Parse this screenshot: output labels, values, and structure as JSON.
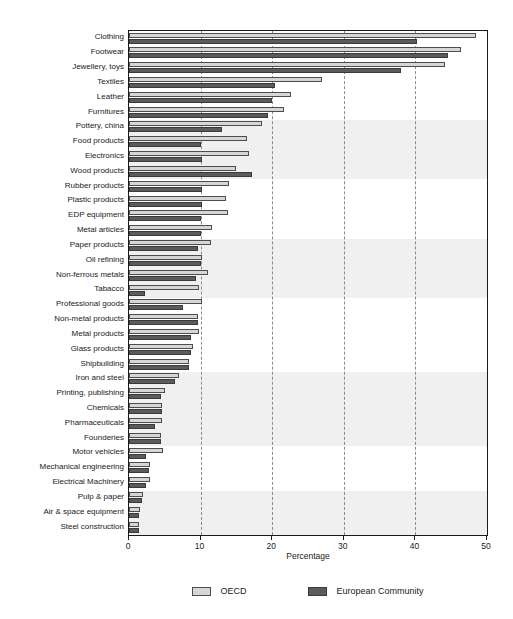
{
  "chart_data": {
    "type": "bar",
    "orientation": "horizontal",
    "title": "",
    "xlabel": "Percentage",
    "ylabel": "",
    "xlim": [
      0,
      50
    ],
    "xticks": [
      0,
      10,
      20,
      30,
      40,
      50
    ],
    "xticklabels": [
      "0",
      "10",
      "20",
      "30",
      "40",
      "50"
    ],
    "gridlines": [
      10,
      20,
      30,
      40
    ],
    "grid": true,
    "legend_position": "bottom",
    "categories": [
      "Clothing",
      "Footwear",
      "Jewellery, toys",
      "Textiles",
      "Leather",
      "Furnitures",
      "Pottery, china",
      "Food products",
      "Electronics",
      "Wood products",
      "Rubber products",
      "Plastic products",
      "EDP equipment",
      "Metal articles",
      "Paper products",
      "Oil refining",
      "Non-ferrous metals",
      "Tabacco",
      "Professional goods",
      "Non-metal products",
      "Metal products",
      "Glass products",
      "Shipbuilding",
      "Iron and steel",
      "Printing, publishing",
      "Chemicals",
      "Pharmaceuticals",
      "Founderies",
      "Motor vehicles",
      "Mechanical engineering",
      "Electrical Machinery",
      "Pulp & paper",
      "Air & space equipment",
      "Steel construction"
    ],
    "series": [
      {
        "name": "OECD",
        "color": "#d6d6d6",
        "values": [
          48.5,
          46.3,
          44.2,
          27.0,
          22.6,
          21.6,
          18.6,
          16.5,
          16.8,
          15.0,
          14.0,
          13.6,
          13.8,
          11.6,
          11.4,
          10.2,
          11.0,
          9.8,
          10.2,
          9.6,
          9.8,
          9.0,
          8.4,
          7.0,
          5.0,
          4.6,
          4.6,
          4.4,
          4.8,
          3.0,
          3.0,
          2.0,
          1.6,
          1.4
        ]
      },
      {
        "name": "European Community",
        "color": "#5b5b5b",
        "values": [
          40.2,
          44.5,
          38.0,
          20.4,
          20.0,
          19.4,
          13.0,
          10.0,
          10.2,
          17.2,
          10.2,
          10.2,
          10.0,
          10.0,
          9.6,
          10.0,
          9.4,
          2.2,
          7.6,
          9.6,
          8.6,
          8.6,
          8.4,
          6.4,
          4.4,
          4.6,
          3.6,
          4.4,
          2.4,
          2.8,
          2.4,
          1.8,
          1.4,
          1.4
        ]
      }
    ],
    "band_groups": [
      {
        "start": 0,
        "end": 6,
        "shaded": false
      },
      {
        "start": 6,
        "end": 10,
        "shaded": true
      },
      {
        "start": 10,
        "end": 14,
        "shaded": false
      },
      {
        "start": 14,
        "end": 18,
        "shaded": true
      },
      {
        "start": 18,
        "end": 23,
        "shaded": false
      },
      {
        "start": 23,
        "end": 28,
        "shaded": true
      },
      {
        "start": 28,
        "end": 31,
        "shaded": false
      },
      {
        "start": 31,
        "end": 34,
        "shaded": true
      }
    ]
  },
  "legend": {
    "items": [
      {
        "label": "OECD",
        "swatch": "oecd"
      },
      {
        "label": "European Community",
        "swatch": "ec"
      }
    ]
  },
  "axis": {
    "x_title": "Percentage"
  }
}
